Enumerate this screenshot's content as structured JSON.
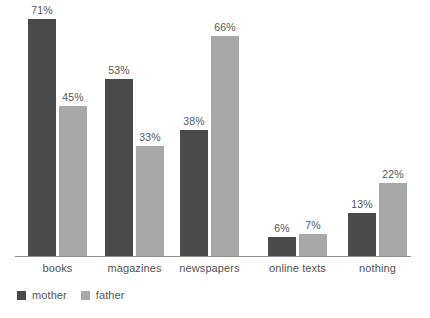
{
  "chart_data": {
    "type": "bar",
    "title": "",
    "subtitle": "",
    "xlabel": "",
    "ylabel": "",
    "grid": false,
    "y_axis_visible": false,
    "legend_position": "bottom-left",
    "value_suffix": "%",
    "ylim": [
      0,
      75
    ],
    "categories": [
      "books",
      "magazines",
      "newspapers",
      "online texts",
      "nothing"
    ],
    "series": [
      {
        "name": "mother",
        "color": "#4a4a4a",
        "values": [
          71,
          53,
          38,
          6,
          13
        ],
        "labels": [
          "71%",
          "53%",
          "38%",
          "6%",
          "13%"
        ]
      },
      {
        "name": "father",
        "color": "#a8a8a8",
        "values": [
          45,
          33,
          66,
          7,
          22
        ],
        "labels": [
          "45%",
          "33%",
          "66%",
          "7%",
          "22%"
        ]
      }
    ]
  },
  "legend": {
    "items": [
      {
        "label": "mother",
        "swatch_name": "legend-swatch-mother"
      },
      {
        "label": "father",
        "swatch_name": "legend-swatch-father"
      }
    ]
  },
  "axis": {
    "baseline_color": "#8d8d8d"
  }
}
